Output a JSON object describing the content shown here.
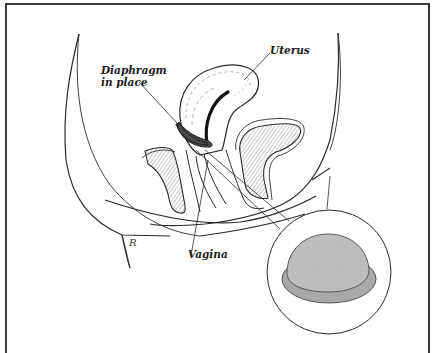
{
  "diagram": {
    "labels": {
      "diaphragm_line1": "Diaphragm",
      "diaphragm_line2": "in place",
      "uterus": "Uterus",
      "vagina": "Vagina"
    },
    "signature": "R",
    "inset": {
      "content": "diaphragm device",
      "fill_color": "#bdbdbd",
      "rim_color": "#a9a9a9"
    },
    "colors": {
      "line": "#2a2a2a",
      "diaphragm_fill": "#4a4a4a",
      "background": "#ffffff",
      "frame": "#3a3a3a"
    }
  }
}
